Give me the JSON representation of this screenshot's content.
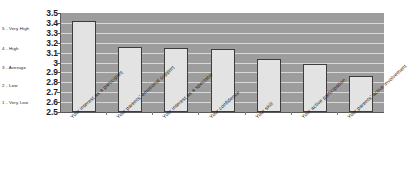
{
  "chart_data": {
    "type": "bar",
    "title": "",
    "xlabel": "",
    "ylabel": "",
    "ylim": [
      2.5,
      3.5
    ],
    "grid": true,
    "legend": "none",
    "categories": [
      "Your interest as a participant",
      "Your parents' emotional support",
      "Your interest as a spectator",
      "Your confidence",
      "Your skill",
      "Your active participation",
      "Your parents' active involvement"
    ],
    "values": [
      3.42,
      3.16,
      3.15,
      3.14,
      3.04,
      2.98,
      2.86
    ],
    "ytick_labels": [
      "3.5",
      "3.4",
      "3.3",
      "3.2",
      "3.1",
      "3",
      "2.9",
      "2.8",
      "2.7",
      "2.6",
      "2.5"
    ],
    "ytick_values": [
      3.5,
      3.4,
      3.3,
      3.2,
      3.1,
      3.0,
      2.9,
      2.8,
      2.7,
      2.6,
      2.5
    ],
    "scale_legend": [
      {
        "label": "5 - Very High",
        "at": 3.35
      },
      {
        "label": "4 - High",
        "at": 3.15
      },
      {
        "label": "3 - Average",
        "at": 2.95
      },
      {
        "label": "2 - Low",
        "at": 2.77
      },
      {
        "label": "1 - Very Low",
        "at": 2.6
      }
    ],
    "colors": {
      "plot_background": "#9d9d9d",
      "gridline": "#d8d8d8",
      "bar_fill": "#e3e3e3",
      "bar_border": "#3d3d3d",
      "axis": "#5a5a5a",
      "text": "#1f1f1f"
    }
  }
}
